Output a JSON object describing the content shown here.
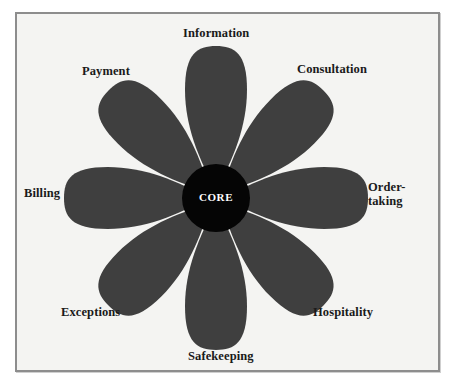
{
  "figure": {
    "kind": "flower-of-service-diagram",
    "core_label": "CORE",
    "colors": {
      "petal": "#3f3f3f",
      "core": "#050505",
      "core_text": "#ffffff",
      "plate_background": "#f4f4f2",
      "frame_border": "#8d8d8d",
      "page_background": "#ffffff",
      "label_text": "#1a1a1a"
    },
    "petals": [
      {
        "id": "information",
        "label": "Information",
        "angle_deg": 0,
        "position": "top"
      },
      {
        "id": "consultation",
        "label": "Consultation",
        "angle_deg": 45,
        "position": "top-right"
      },
      {
        "id": "order-taking",
        "label": "Order-\ntaking",
        "angle_deg": 90,
        "position": "right"
      },
      {
        "id": "hospitality",
        "label": "Hospitality",
        "angle_deg": 135,
        "position": "bottom-right"
      },
      {
        "id": "safekeeping",
        "label": "Safekeeping",
        "angle_deg": 180,
        "position": "bottom"
      },
      {
        "id": "exceptions",
        "label": "Exceptions",
        "angle_deg": 225,
        "position": "bottom-left"
      },
      {
        "id": "billing",
        "label": "Billing",
        "angle_deg": 270,
        "position": "left"
      },
      {
        "id": "payment",
        "label": "Payment",
        "angle_deg": 315,
        "position": "top-left"
      }
    ],
    "geometry": {
      "center_x": 216,
      "center_y": 198,
      "core_radius": 34,
      "petal_length": 152,
      "petal_half_width": 31,
      "petal_count": 8
    }
  }
}
